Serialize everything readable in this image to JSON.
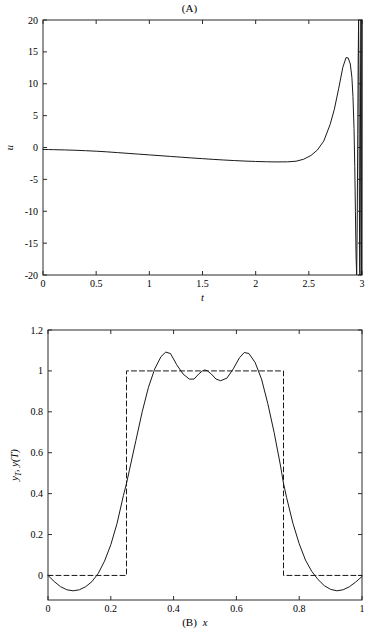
{
  "figure": {
    "panel_a_title": "(A)",
    "panel_b_caption": "(B)"
  },
  "chart_data": [
    {
      "id": "panel-a",
      "type": "line",
      "title": "(A)",
      "xlabel": "t",
      "ylabel": "u",
      "xlim": [
        0,
        3
      ],
      "ylim": [
        -20,
        20
      ],
      "xticks": [
        0,
        0.5,
        1,
        1.5,
        2,
        2.5,
        3
      ],
      "xticklabels": [
        "0",
        "0.5",
        "1",
        "1.5",
        "2",
        "2.5",
        "3"
      ],
      "yticks": [
        -20,
        -15,
        -10,
        -5,
        0,
        5,
        10,
        15,
        20
      ],
      "yticklabels": [
        "-20",
        "-15",
        "-10",
        "-5",
        "0",
        "5",
        "10",
        "15",
        "20"
      ],
      "grid": false,
      "legend": "none",
      "series": [
        {
          "name": "u(t)",
          "style": "solid",
          "x": [
            0.0,
            0.05,
            0.1,
            0.15,
            0.2,
            0.3,
            0.4,
            0.5,
            0.6,
            0.7,
            0.8,
            0.9,
            1.0,
            1.1,
            1.2,
            1.3,
            1.4,
            1.5,
            1.6,
            1.7,
            1.8,
            1.9,
            2.0,
            2.1,
            2.2,
            2.3,
            2.38,
            2.45,
            2.52,
            2.58,
            2.64,
            2.7,
            2.74,
            2.78,
            2.82,
            2.85,
            2.87,
            2.89,
            2.905,
            2.915,
            2.925,
            2.932,
            2.938,
            2.944,
            2.95,
            2.955,
            2.96,
            2.964,
            2.968,
            2.972,
            2.975,
            2.978,
            2.981,
            2.984,
            2.987,
            2.99,
            2.992,
            2.994,
            2.996,
            2.998,
            3.0
          ],
          "y": [
            -0.3,
            -0.32,
            -0.34,
            -0.36,
            -0.38,
            -0.43,
            -0.5,
            -0.58,
            -0.68,
            -0.8,
            -0.92,
            -1.04,
            -1.16,
            -1.28,
            -1.4,
            -1.52,
            -1.64,
            -1.75,
            -1.86,
            -1.96,
            -2.05,
            -2.13,
            -2.19,
            -2.24,
            -2.26,
            -2.25,
            -2.15,
            -1.85,
            -1.25,
            -0.4,
            1.0,
            3.6,
            6.0,
            9.2,
            12.6,
            14.1,
            14.05,
            13.1,
            11.0,
            8.0,
            3.0,
            -3.0,
            -10.0,
            -17.0,
            -20.0,
            -12.0,
            2.0,
            13.0,
            20.0,
            10.0,
            -6.0,
            -19.0,
            -20.0,
            -5.0,
            12.0,
            20.0,
            6.0,
            -14.0,
            -20.0,
            -2.0,
            20.0
          ]
        }
      ],
      "notes": "Control signal u(t) stays near -0.3 to -2.3 until t~2.5, rises to a peak of about 14.1 near t=2.87, then oscillates with rapidly growing amplitude clipped by the axis limits at t=3."
    },
    {
      "id": "panel-b",
      "type": "line",
      "title": "",
      "caption": "(B)",
      "xlabel": "x",
      "ylabel": "y_T, y(T)",
      "ylabel_parts": [
        "y",
        "T",
        ", ",
        "y",
        "(",
        "T",
        ")"
      ],
      "xlim": [
        0,
        1
      ],
      "ylim": [
        -0.12,
        1.2
      ],
      "xticks": [
        0,
        0.2,
        0.4,
        0.6,
        0.8,
        1
      ],
      "xticklabels": [
        "0",
        "0.2",
        "0.4",
        "0.6",
        "0.8",
        "1"
      ],
      "yticks": [
        0,
        0.2,
        0.4,
        0.6,
        0.8,
        1,
        1.2
      ],
      "yticklabels": [
        "0",
        "0.2",
        "0.4",
        "0.6",
        "0.8",
        "1",
        "1.2"
      ],
      "grid": false,
      "legend": "none",
      "series": [
        {
          "name": "y_T (target)",
          "style": "dashed",
          "x": [
            0.0,
            0.25,
            0.25,
            0.75,
            0.75,
            1.0
          ],
          "y": [
            0.0,
            0.0,
            1.0,
            1.0,
            0.0,
            0.0
          ]
        },
        {
          "name": "y(T) (achieved)",
          "style": "solid",
          "x": [
            0.0,
            0.02,
            0.04,
            0.06,
            0.08,
            0.1,
            0.12,
            0.14,
            0.16,
            0.18,
            0.2,
            0.22,
            0.24,
            0.25,
            0.26,
            0.28,
            0.3,
            0.32,
            0.34,
            0.36,
            0.375,
            0.39,
            0.41,
            0.43,
            0.45,
            0.465,
            0.48,
            0.492,
            0.5,
            0.508,
            0.52,
            0.535,
            0.55,
            0.57,
            0.59,
            0.61,
            0.625,
            0.64,
            0.66,
            0.68,
            0.7,
            0.72,
            0.74,
            0.75,
            0.76,
            0.78,
            0.8,
            0.82,
            0.84,
            0.86,
            0.88,
            0.9,
            0.92,
            0.94,
            0.96,
            0.98,
            1.0
          ],
          "y": [
            0.0,
            -0.03,
            -0.055,
            -0.07,
            -0.075,
            -0.07,
            -0.055,
            -0.03,
            0.01,
            0.07,
            0.15,
            0.255,
            0.39,
            0.45,
            0.52,
            0.66,
            0.8,
            0.92,
            1.01,
            1.07,
            1.092,
            1.085,
            1.03,
            0.985,
            0.96,
            0.96,
            0.985,
            1.0,
            1.005,
            1.0,
            0.985,
            0.96,
            0.952,
            0.965,
            1.01,
            1.065,
            1.09,
            1.085,
            1.04,
            0.96,
            0.84,
            0.7,
            0.54,
            0.45,
            0.38,
            0.255,
            0.155,
            0.075,
            0.02,
            -0.02,
            -0.05,
            -0.068,
            -0.075,
            -0.07,
            -0.055,
            -0.032,
            -0.005
          ]
        }
      ],
      "notes": "Dashed curve is the rectangular target profile y_T equal to 1 on [0.25,0.75] and 0 elsewhere; solid curve is the reached state y(T), a smooth approximation overshooting to about 1.09 and undershooting to about -0.075."
    }
  ]
}
